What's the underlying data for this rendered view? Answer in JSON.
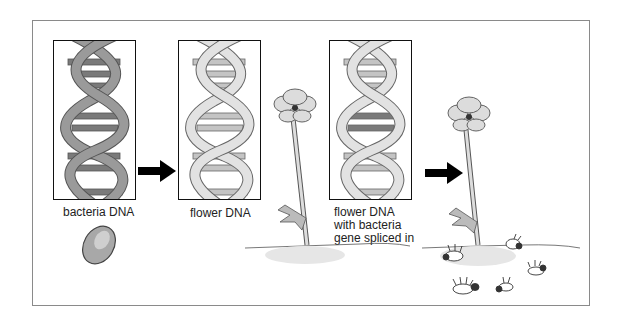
{
  "diagram": {
    "title": "",
    "panels": [
      {
        "id": "bacteria",
        "label": "bacteria DNA",
        "strand_shade": "#9a9a9a",
        "rung_shade": "#7a7a7a"
      },
      {
        "id": "flower",
        "label": "flower DNA",
        "strand_shade": "#d2d2d2",
        "rung_shade": "#bdbdbd"
      },
      {
        "id": "modified",
        "label_lines": [
          "flower DNA",
          "with bacteria",
          "gene spliced in"
        ],
        "strand_shade": "#cfcfcf",
        "rung_shade": "#8a8a8a"
      }
    ],
    "arrows": [
      {
        "from": "bacteria",
        "to": "flower"
      },
      {
        "from": "modified",
        "to": "plant-with-insects"
      }
    ],
    "illustrations": [
      {
        "name": "bacterium",
        "description": "oval bacterium cell"
      },
      {
        "name": "flower-plant",
        "description": "flower on tall stem with leaf, in soil"
      },
      {
        "name": "plant-with-insects",
        "description": "flower on tall stem with leaf, insects dead/on backs in soil"
      }
    ],
    "colors": {
      "outline": "#111111",
      "frame": "#8a8a8a",
      "arrow": "#000000",
      "text": "#222222"
    }
  }
}
